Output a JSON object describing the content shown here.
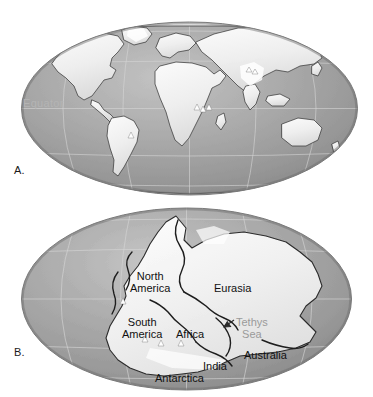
{
  "figure": {
    "background_color": "#ffffff",
    "width": 373,
    "height": 397,
    "ocean_color": "#9b9b9b",
    "ocean_color_light": "#b9b9b9",
    "land_color": "#f2f2f2",
    "coast_color": "#2b2b2b",
    "graticule_color": "#d8d8d8",
    "label_color": "#111111",
    "muted_label_color": "#9a9a9a",
    "equator_label_color": "#b4b4b4"
  },
  "panels": [
    {
      "id": "panel-a",
      "label": "A.",
      "caption": "Present-day world map, Mollweide projection",
      "labels": [
        {
          "name": "equator-label",
          "text": "Equator",
          "x": 23,
          "y": 98,
          "style": "equator"
        }
      ]
    },
    {
      "id": "panel-b",
      "label": "B.",
      "caption": "Pangaea supercontinent reconstruction, Mollweide projection",
      "labels": [
        {
          "name": "label-north-america",
          "text": "North\nAmerica",
          "x": 130,
          "y": 70,
          "style": "dark"
        },
        {
          "name": "label-eurasia",
          "text": "Eurasia",
          "x": 214,
          "y": 82,
          "style": "dark"
        },
        {
          "name": "label-south-america",
          "text": "South\nAmerica",
          "x": 122,
          "y": 116,
          "style": "dark"
        },
        {
          "name": "label-africa",
          "text": "Africa",
          "x": 176,
          "y": 128,
          "style": "dark"
        },
        {
          "name": "label-tethys-sea",
          "text": "Tethys\nSea",
          "x": 236,
          "y": 116,
          "style": "gray"
        },
        {
          "name": "label-australia",
          "text": "Australia",
          "x": 244,
          "y": 149,
          "style": "dark"
        },
        {
          "name": "label-india",
          "text": "India",
          "x": 203,
          "y": 160,
          "style": "dark"
        },
        {
          "name": "label-antarctica",
          "text": "Antarctica",
          "x": 155,
          "y": 172,
          "style": "dark"
        }
      ]
    }
  ]
}
